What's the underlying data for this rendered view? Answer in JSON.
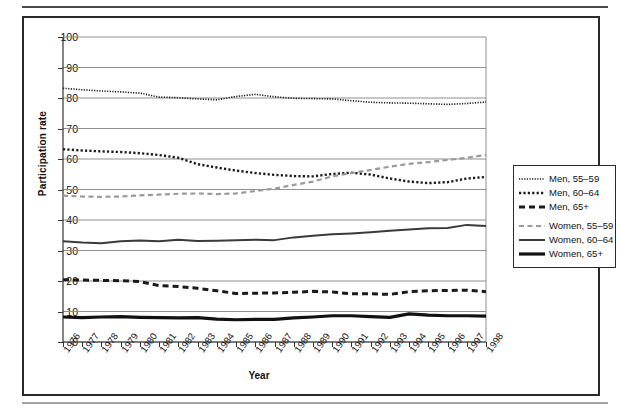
{
  "chart_data": {
    "type": "line",
    "title": "",
    "xlabel": "Year",
    "ylabel": "Participation rate",
    "xlim": [
      1976,
      1998
    ],
    "ylim": [
      0,
      100
    ],
    "grid": true,
    "legend_position": "right",
    "categories": [
      1976,
      1977,
      1978,
      1979,
      1980,
      1981,
      1982,
      1983,
      1984,
      1985,
      1986,
      1987,
      1988,
      1989,
      1990,
      1991,
      1992,
      1993,
      1994,
      1995,
      1996,
      1997,
      1998
    ],
    "x_tick_labels": [
      "1976",
      "1977",
      "1978",
      "1979",
      "1980",
      "1981",
      "1982",
      "1983",
      "1984",
      "1985",
      "1986",
      "1987",
      "1988",
      "1989",
      "1990",
      "1991",
      "1992",
      "1993",
      "1994",
      "1995",
      "1996",
      "1997",
      "1998"
    ],
    "y_tick_labels": [
      "0",
      "10",
      "20",
      "30",
      "40",
      "50",
      "60",
      "70",
      "80",
      "90",
      "100"
    ],
    "y_ticks": [
      0,
      10,
      20,
      30,
      40,
      50,
      60,
      70,
      80,
      90,
      100
    ],
    "series": [
      {
        "name": "Men, 55–59",
        "style": "fine-dotted",
        "color": "#1a1a1a",
        "width": 1.6,
        "values": [
          83.2,
          82.7,
          82.3,
          82.0,
          81.6,
          80.3,
          80.1,
          79.7,
          79.4,
          80.5,
          81.2,
          80.4,
          79.9,
          79.8,
          79.7,
          79.1,
          78.6,
          78.4,
          78.3,
          78.1,
          77.9,
          78.2,
          78.7
        ]
      },
      {
        "name": "Men, 60–64",
        "style": "dotted",
        "color": "#1a1a1a",
        "width": 2.4,
        "values": [
          63.2,
          62.8,
          62.5,
          62.3,
          61.9,
          61.3,
          60.4,
          58.3,
          57.2,
          56.2,
          55.4,
          54.8,
          54.4,
          54.3,
          55.1,
          55.5,
          54.9,
          53.6,
          52.6,
          52.1,
          52.4,
          53.6,
          54.1
        ]
      },
      {
        "name": "Men, 65+",
        "style": "dashed",
        "color": "#1a1a1a",
        "width": 3.0,
        "values": [
          20.4,
          20.3,
          20.2,
          20.1,
          19.8,
          18.5,
          18.2,
          17.6,
          16.8,
          15.9,
          16.0,
          16.1,
          16.3,
          16.6,
          16.4,
          15.8,
          15.8,
          15.6,
          16.5,
          16.8,
          16.9,
          17.0,
          16.5
        ]
      },
      {
        "name": "Women, 55–59",
        "style": "gray-dashed",
        "color": "#9a9a9a",
        "width": 2.2,
        "values": [
          48.0,
          47.7,
          47.6,
          47.7,
          48.1,
          48.3,
          48.6,
          48.7,
          48.5,
          48.7,
          49.5,
          50.3,
          51.5,
          52.6,
          54.3,
          55.4,
          56.4,
          57.5,
          58.4,
          59.0,
          59.7,
          60.4,
          61.3
        ]
      },
      {
        "name": "Women, 60–64",
        "style": "solid-thin",
        "color": "#3a3a3a",
        "width": 2.0,
        "values": [
          33.0,
          32.6,
          32.4,
          33.0,
          33.3,
          33.0,
          33.5,
          33.1,
          33.2,
          33.4,
          33.5,
          33.4,
          34.3,
          34.8,
          35.3,
          35.6,
          36.0,
          36.5,
          36.9,
          37.3,
          37.4,
          38.4,
          38.0
        ]
      },
      {
        "name": "Women, 65+",
        "style": "solid-thick",
        "color": "#111111",
        "width": 3.2,
        "values": [
          8.2,
          8.0,
          8.2,
          8.3,
          8.1,
          8.0,
          7.9,
          8.0,
          7.5,
          7.3,
          7.4,
          7.4,
          7.9,
          8.2,
          8.6,
          8.6,
          8.3,
          8.1,
          9.2,
          8.8,
          8.6,
          8.6,
          8.5
        ]
      }
    ],
    "legend_entries": [
      {
        "label": "Men, 55–59",
        "style": "fine-dotted"
      },
      {
        "label": "Men, 60–64",
        "style": "dotted"
      },
      {
        "label": "Men, 65+",
        "style": "dashed"
      },
      {
        "label": "Women, 55–59",
        "style": "gray-dashed"
      },
      {
        "label": "Women, 60–64",
        "style": "solid-thin"
      },
      {
        "label": "Women, 65+",
        "style": "solid-thick"
      }
    ]
  },
  "colors": {
    "grid": "#8f8f8f",
    "axis": "#333333",
    "frame": "#2a2a2a",
    "rule": "#4a4a4a"
  }
}
